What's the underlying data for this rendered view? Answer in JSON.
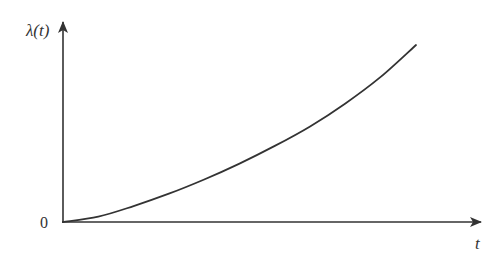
{
  "chart_data": {
    "type": "line",
    "title": "",
    "xlabel": "t",
    "ylabel": "λ(t)",
    "origin_label": "0",
    "grid": false,
    "legend": null,
    "axis_arrows": true,
    "ticks": {
      "x": [],
      "y": []
    },
    "series": [
      {
        "name": "λ(t)",
        "x": [
          0,
          0.1,
          0.2,
          0.3,
          0.4,
          0.5,
          0.6,
          0.7,
          0.8,
          0.9,
          1.0
        ],
        "values": [
          0,
          0.03,
          0.09,
          0.16,
          0.24,
          0.33,
          0.43,
          0.54,
          0.67,
          0.82,
          1.0
        ]
      }
    ],
    "xlim": [
      0,
      1.18
    ],
    "ylim": [
      0,
      1.13
    ]
  },
  "colors": {
    "axis": "#333333",
    "curve": "#333333",
    "background": "#ffffff"
  }
}
